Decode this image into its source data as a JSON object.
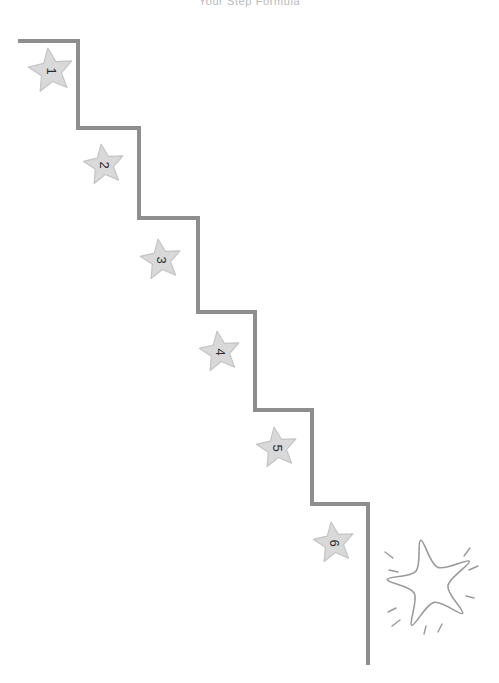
{
  "page": {
    "width": 499,
    "height": 683,
    "background": "#ffffff",
    "title": "Your Step Formula",
    "title_color": "#b9b9bd"
  },
  "colors": {
    "staircase_line": "#8e8e8e",
    "star_fill": "#d9d9d9",
    "star_stroke": "#c4c4c4",
    "star_number": "#2b2b2b",
    "sparkle_star_stroke": "#9a9a9a",
    "sparkle_ray_stroke": "#9a9a9a"
  },
  "staircase": {
    "name": "descending-staircase-path",
    "stroke_width": 4,
    "points": [
      {
        "x": 18,
        "y": 41
      },
      {
        "x": 78,
        "y": 41
      },
      {
        "x": 78,
        "y": 128
      },
      {
        "x": 139,
        "y": 128
      },
      {
        "x": 139,
        "y": 218
      },
      {
        "x": 198,
        "y": 218
      },
      {
        "x": 198,
        "y": 312
      },
      {
        "x": 255,
        "y": 312
      },
      {
        "x": 255,
        "y": 410
      },
      {
        "x": 312,
        "y": 410
      },
      {
        "x": 312,
        "y": 504
      },
      {
        "x": 368,
        "y": 504
      },
      {
        "x": 368,
        "y": 665
      }
    ]
  },
  "steps": [
    {
      "label": "1",
      "cx": 51,
      "cy": 71,
      "r": 23,
      "rotation": 90
    },
    {
      "label": "2",
      "cx": 104,
      "cy": 165,
      "r": 21,
      "rotation": 90
    },
    {
      "label": "3",
      "cx": 161,
      "cy": 260,
      "r": 21,
      "rotation": 90
    },
    {
      "label": "4",
      "cx": 220,
      "cy": 352,
      "r": 21,
      "rotation": 90
    },
    {
      "label": "5",
      "cx": 277,
      "cy": 448,
      "r": 21,
      "rotation": 90
    },
    {
      "label": "6",
      "cx": 334,
      "cy": 543,
      "r": 21,
      "rotation": 90
    }
  ],
  "sparkle_star": {
    "name": "hand-drawn-sparkle-star",
    "cx": 430,
    "cy": 584,
    "radius": 43,
    "stroke_width": 1.6,
    "rays": [
      {
        "x1": 385,
        "y1": 552,
        "x2": 393,
        "y2": 558
      },
      {
        "x1": 389,
        "y1": 570,
        "x2": 398,
        "y2": 572
      },
      {
        "x1": 388,
        "y1": 612,
        "x2": 396,
        "y2": 608
      },
      {
        "x1": 392,
        "y1": 626,
        "x2": 400,
        "y2": 620
      },
      {
        "x1": 470,
        "y1": 548,
        "x2": 464,
        "y2": 556
      },
      {
        "x1": 478,
        "y1": 566,
        "x2": 469,
        "y2": 570
      },
      {
        "x1": 474,
        "y1": 598,
        "x2": 466,
        "y2": 596
      },
      {
        "x1": 438,
        "y1": 632,
        "x2": 442,
        "y2": 624
      },
      {
        "x1": 424,
        "y1": 634,
        "x2": 426,
        "y2": 626
      }
    ]
  }
}
